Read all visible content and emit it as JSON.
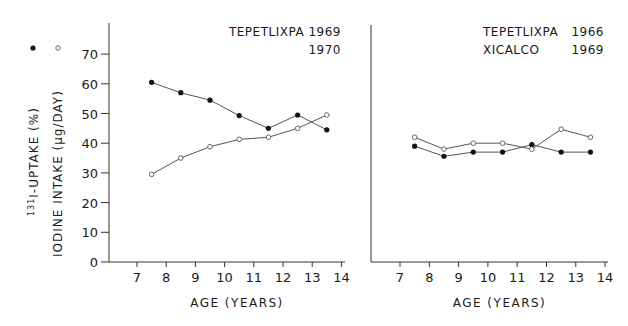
{
  "chart_data": {
    "type": "line",
    "shared_y": {
      "label_primary": "131I-UPTAKE (%)",
      "label_primary_sup": "131",
      "label_primary_text": "I-UPTAKE (%)",
      "label_secondary": "IODINE INTAKE (µg/DAY)",
      "ticks": [
        0,
        10,
        20,
        30,
        40,
        50,
        60,
        70
      ],
      "ylim": [
        0,
        70
      ]
    },
    "legend": [
      {
        "marker": "filled-circle",
        "series": "131I-UPTAKE (%)"
      },
      {
        "marker": "open-circle",
        "series": "IODINE INTAKE (µg/DAY)"
      }
    ],
    "panels": [
      {
        "title_lines": [
          "TEPETLIXPA 1969",
          "1970"
        ],
        "xlabel": "AGE (YEARS)",
        "x_ticks": [
          7,
          8,
          9,
          10,
          11,
          12,
          13,
          14
        ],
        "x": [
          7.5,
          8.5,
          9.5,
          10.5,
          11.5,
          12.5,
          13.5
        ],
        "series": [
          {
            "name": "131I-UPTAKE (%)",
            "marker": "filled",
            "values": [
              60.5,
              57,
              54.5,
              49.3,
              45,
              49.5,
              44.5
            ]
          },
          {
            "name": "IODINE INTAKE (µg/DAY)",
            "marker": "open",
            "values": [
              29.5,
              35,
              38.8,
              41.3,
              42,
              45,
              49.5
            ]
          }
        ]
      },
      {
        "title_lines": [
          "TEPETLIXPA 1966",
          "XICALCO       1969"
        ],
        "title_rows": [
          [
            "TEPETLIXPA",
            "1966"
          ],
          [
            "XICALCO",
            "1969"
          ]
        ],
        "xlabel": "AGE (YEARS)",
        "x_ticks": [
          7,
          8,
          9,
          10,
          11,
          12,
          13,
          14
        ],
        "x": [
          7.5,
          8.5,
          9.5,
          10.5,
          11.5,
          12.5,
          13.5
        ],
        "series": [
          {
            "name": "131I-UPTAKE (%)",
            "marker": "filled",
            "values": [
              39,
              35.6,
              37,
              37,
              39.5,
              37,
              37
            ]
          },
          {
            "name": "IODINE INTAKE (µg/DAY)",
            "marker": "open",
            "values": [
              42,
              38,
              40,
              40,
              38,
              44.7,
              42
            ]
          }
        ]
      }
    ],
    "grid": false
  }
}
